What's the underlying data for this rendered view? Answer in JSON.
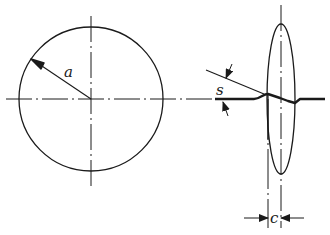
{
  "diagram": {
    "type": "technical-drawing",
    "colors": {
      "line": "#1a1a1a",
      "background": "#ffffff"
    },
    "left_view": {
      "shape": "circle",
      "radius_label": "a",
      "centerlines": [
        "horizontal",
        "vertical"
      ]
    },
    "right_view": {
      "shape": "ellipse",
      "angle_label": "s",
      "width_label": "c",
      "profile": "thick deformed line with bump and dip"
    }
  }
}
